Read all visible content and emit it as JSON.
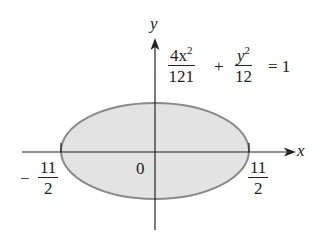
{
  "diagram": {
    "type": "ellipse-on-axes",
    "colors": {
      "fill": "#e3e3e3",
      "stroke": "#8a8a8a",
      "axis": "#222222",
      "background": "#ffffff"
    },
    "axes": {
      "x_label": "x",
      "y_label": "y"
    },
    "origin_label": "0",
    "left_intercept": {
      "sign": "−",
      "numerator": "11",
      "denominator": "2"
    },
    "right_intercept": {
      "numerator": "11",
      "denominator": "2"
    },
    "equation": {
      "term1": {
        "numerator_base": "4x",
        "numerator_exp": "2",
        "denominator": "121"
      },
      "plus": "+",
      "term2": {
        "numerator_base": "y",
        "numerator_exp": "2",
        "denominator": "12"
      },
      "equals": "= 1"
    }
  }
}
